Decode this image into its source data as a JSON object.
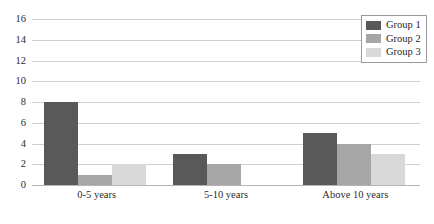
{
  "chart_data": {
    "type": "bar",
    "title": "",
    "subtitle": "",
    "xlabel": "",
    "ylabel": "",
    "categories": [
      "0-5 years",
      "5-10 years",
      "Above 10 years"
    ],
    "series": [
      {
        "name": "Group 1",
        "color": "#595959",
        "values": [
          8,
          3,
          5
        ]
      },
      {
        "name": "Group 2",
        "color": "#a6a6a6",
        "values": [
          1,
          2,
          4
        ]
      },
      {
        "name": "Group 3",
        "color": "#d9d9d9",
        "values": [
          2,
          0,
          3
        ]
      }
    ],
    "ylim": [
      0,
      16
    ],
    "ytick_step": 2,
    "yticks": [
      0,
      2,
      4,
      6,
      8,
      10,
      12,
      14,
      16
    ],
    "ytick_labels": [
      "0",
      "2",
      "4",
      "6",
      "8",
      "10",
      "12",
      "14",
      "16"
    ],
    "grid": true,
    "grid_axis": "y",
    "legend": true,
    "legend_position": "top-right",
    "legend_entries": [
      "Group 1",
      "Group 2",
      "Group 3"
    ],
    "grouping": "clustered",
    "orientation": "vertical",
    "grid_color": "#d0d0d0",
    "axis_color": "#b5b5b5",
    "background": "#ffffff"
  }
}
